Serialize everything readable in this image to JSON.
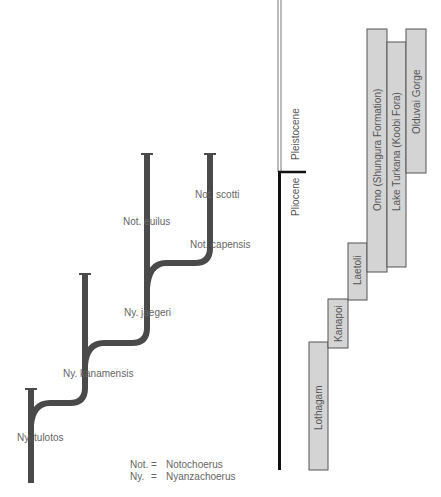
{
  "colors": {
    "branch": "#4a4a4a",
    "box_fill": "#d4d4d4",
    "box_stroke": "#555555",
    "epoch_line": "#111111",
    "label": "#666666"
  },
  "tree": {
    "taxa": [
      {
        "id": "tulotos",
        "label": "Ny. tulotos"
      },
      {
        "id": "kanamensis",
        "label": "Ny. kanamensis"
      },
      {
        "id": "jaegeri",
        "label": "Ny. jaegeri"
      },
      {
        "id": "euilus",
        "label": "Not. euilus"
      },
      {
        "id": "capensis",
        "label": "Not. capensis"
      },
      {
        "id": "scotti",
        "label": "Not. scotti"
      }
    ]
  },
  "legend": [
    {
      "abbr": "Not.",
      "eq": "=",
      "full": "Notochoerus"
    },
    {
      "abbr": "Ny.",
      "eq": "=",
      "full": "Nyanzachoerus"
    }
  ],
  "epochs": [
    {
      "label": "Pleistocene"
    },
    {
      "label": "Pliocene"
    }
  ],
  "sites": [
    {
      "label": "Lothagam"
    },
    {
      "label": "Kanapoi"
    },
    {
      "label": "Laetoli"
    },
    {
      "label": "Omo (Shungura Formation)"
    },
    {
      "label": "Lake Turkana (Koobi Fora)"
    },
    {
      "label": "Olduvai Gorge"
    }
  ]
}
